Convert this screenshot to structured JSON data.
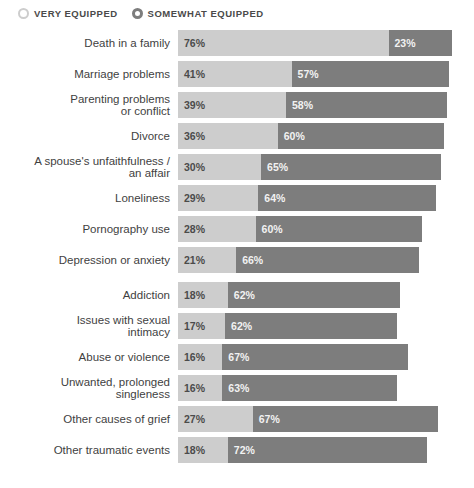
{
  "legend": {
    "items": [
      {
        "label": "VERY EQUIPPED",
        "marker": "circle-outline-icon",
        "color": "#cdcdcd"
      },
      {
        "label": "SOMEWHAT EQUIPPED",
        "marker": "circle-outline-icon",
        "color": "#7d7d7d"
      }
    ]
  },
  "chart_data": {
    "type": "bar",
    "title": "",
    "subtitle": "",
    "xlabel": "",
    "ylabel": "",
    "orientation": "horizontal",
    "stacked": true,
    "grid": false,
    "legend_position": "top-left",
    "xlim": [
      0,
      100
    ],
    "value_suffix": "%",
    "colors": {
      "very": "#cdcdcd",
      "somewhat": "#7d7d7d"
    },
    "categories": [
      "Death in a family",
      "Marriage problems",
      "Parenting problems\nor conflict",
      "Divorce",
      "A spouse's unfaithfulness /\nan affair",
      "Loneliness",
      "Pornography use",
      "Depression or anxiety",
      "Addiction",
      "Issues with sexual\nintimacy",
      "Abuse or violence",
      "Unwanted, prolonged\nsingleness",
      "Other causes of grief",
      "Other traumatic events"
    ],
    "series": [
      {
        "name": "VERY EQUIPPED",
        "color": "#cdcdcd",
        "values": [
          76,
          41,
          39,
          36,
          30,
          29,
          28,
          21,
          18,
          17,
          16,
          16,
          27,
          18
        ]
      },
      {
        "name": "SOMEWHAT EQUIPPED",
        "color": "#7d7d7d",
        "values": [
          23,
          57,
          58,
          60,
          65,
          64,
          60,
          66,
          62,
          62,
          67,
          63,
          67,
          72
        ]
      }
    ],
    "group_breaks": [
      8
    ]
  },
  "rows": [
    {
      "label": "Death in a family",
      "very": "76%",
      "somewhat": "23%",
      "very_val": 76,
      "somewhat_val": 23
    },
    {
      "label": "Marriage problems",
      "very": "41%",
      "somewhat": "57%",
      "very_val": 41,
      "somewhat_val": 57
    },
    {
      "label": "Parenting problems\nor conflict",
      "very": "39%",
      "somewhat": "58%",
      "very_val": 39,
      "somewhat_val": 58
    },
    {
      "label": "Divorce",
      "very": "36%",
      "somewhat": "60%",
      "very_val": 36,
      "somewhat_val": 60
    },
    {
      "label": "A spouse's unfaithfulness /\nan affair",
      "very": "30%",
      "somewhat": "65%",
      "very_val": 30,
      "somewhat_val": 65
    },
    {
      "label": "Loneliness",
      "very": "29%",
      "somewhat": "64%",
      "very_val": 29,
      "somewhat_val": 64
    },
    {
      "label": "Pornography use",
      "very": "28%",
      "somewhat": "60%",
      "very_val": 28,
      "somewhat_val": 60
    },
    {
      "label": "Depression or anxiety",
      "very": "21%",
      "somewhat": "66%",
      "very_val": 21,
      "somewhat_val": 66
    },
    {
      "label": "Addiction",
      "very": "18%",
      "somewhat": "62%",
      "very_val": 18,
      "somewhat_val": 62
    },
    {
      "label": "Issues with sexual\nintimacy",
      "very": "17%",
      "somewhat": "62%",
      "very_val": 17,
      "somewhat_val": 62
    },
    {
      "label": "Abuse or violence",
      "very": "16%",
      "somewhat": "67%",
      "very_val": 16,
      "somewhat_val": 67
    },
    {
      "label": "Unwanted, prolonged\nsingleness",
      "very": "16%",
      "somewhat": "63%",
      "very_val": 16,
      "somewhat_val": 63
    },
    {
      "label": "Other causes of grief",
      "very": "27%",
      "somewhat": "67%",
      "very_val": 27,
      "somewhat_val": 67
    },
    {
      "label": "Other traumatic events",
      "very": "18%",
      "somewhat": "72%",
      "very_val": 18,
      "somewhat_val": 72
    }
  ]
}
